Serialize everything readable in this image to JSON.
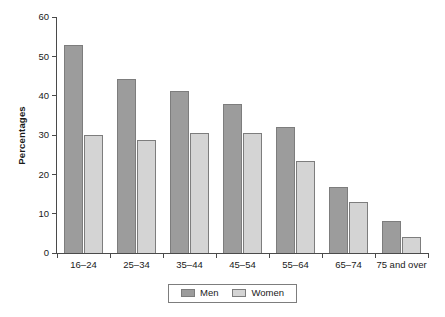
{
  "chart_data": {
    "type": "bar",
    "title": "",
    "subtitle": "",
    "xlabel": "",
    "ylabel": "Percentages",
    "categories": [
      "16–24",
      "25–34",
      "35–44",
      "45–54",
      "55–64",
      "65–74",
      "75 and over"
    ],
    "series": [
      {
        "name": "Men",
        "color": "#9c9c9c",
        "values": [
          53,
          44.2,
          41.2,
          38,
          32.1,
          16.9,
          8.2
        ]
      },
      {
        "name": "Women",
        "color": "#d4d4d4",
        "values": [
          30.1,
          28.7,
          30.5,
          30.5,
          23.3,
          12.9,
          4
        ]
      }
    ],
    "ylim": [
      0,
      60
    ],
    "ytick_values": [
      0,
      10,
      20,
      30,
      40,
      50,
      60
    ],
    "ytick_labels": [
      "0",
      "10",
      "20",
      "30",
      "40",
      "50",
      "60"
    ],
    "grid": false,
    "legend_position": "bottom-center",
    "legend_entries": [
      "Men",
      "Women"
    ],
    "annotations": []
  },
  "axes": {
    "y_label": "Percentages",
    "y_ticks": [
      "60",
      "50",
      "40",
      "30",
      "20",
      "10",
      "0"
    ]
  },
  "legend": {
    "men_label": "Men",
    "women_label": "Women"
  },
  "colors": {
    "men": "#9c9c9c",
    "women": "#d4d4d4",
    "bar_border": "#7d7d7d",
    "axis": "#4a4a4a",
    "text": "#1a1a1a",
    "background": "#ffffff"
  }
}
